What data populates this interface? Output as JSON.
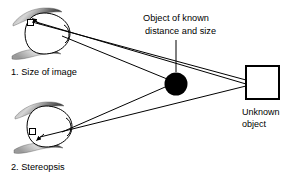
{
  "figure": {
    "background_color": "#ffffff",
    "line_color": "#000000",
    "text_color": "#000000",
    "width": 291,
    "height": 177
  },
  "labels": {
    "cue_1": "1. Size of image",
    "cue_2": "2. Stereopsis",
    "known_object_line1": "Object of known",
    "known_object_line2": "distance and size",
    "unknown_object_line1": "Unknown",
    "unknown_object_line2": "object"
  },
  "elements": {
    "eye_top": {
      "name": "eye-top",
      "description": "upper eye with eyelids, lens and retinal image square"
    },
    "eye_bottom": {
      "name": "eye-bottom",
      "description": "lower eye with eyelids, lens and retinal image square"
    },
    "known_object": {
      "name": "known-object-dot",
      "shape": "filled circle",
      "fill": "#000000"
    },
    "unknown_object": {
      "name": "unknown-object-square",
      "shape": "open square",
      "stroke": "#000000",
      "fill": "#ffffff"
    }
  }
}
